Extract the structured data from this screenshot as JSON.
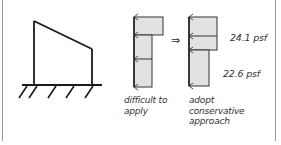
{
  "figure": {
    "frame": {
      "type": "portal-frame-with-sloped-roof",
      "support": "fixed-ground"
    },
    "diagram_left": {
      "caption_lines": [
        "difficult to",
        "apply"
      ]
    },
    "implies_symbol": "⇒",
    "diagram_right": {
      "caption_lines": [
        "adopt",
        "conservative",
        "approach"
      ],
      "upper_load_label": "24.1 psf",
      "lower_load_label": "22.6 psf"
    },
    "colors": {
      "line": "#1a1a1a",
      "fill": "#e2e2e2",
      "text": "#333333",
      "border": "#9a9a9a"
    }
  }
}
